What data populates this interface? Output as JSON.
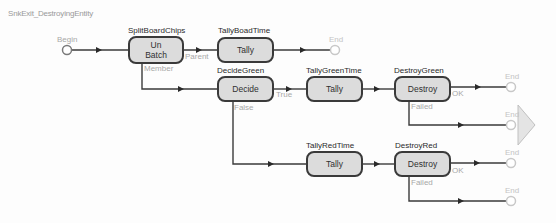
{
  "title": "SnkExit_DestroyingEntity",
  "colors": {
    "node_fill": "#dcdcdc",
    "node_border": "#3a3a3a",
    "connector": "#3a3a3a",
    "terminal": "#c8c8c8",
    "port_label": "#a8a8a8"
  },
  "terminals": {
    "begin": "Begin",
    "end": "End"
  },
  "nodes": {
    "split": {
      "name": "SplitBoardChips",
      "type_line1": "Un",
      "type_line2": "Batch"
    },
    "tally_board": {
      "name": "TallyBoadTime",
      "type": "Tally"
    },
    "decide_green": {
      "name": "DecideGreen",
      "type": "Decide"
    },
    "tally_green": {
      "name": "TallyGreenTime",
      "type": "Tally"
    },
    "destroy_green": {
      "name": "DestroyGreen",
      "type": "Destroy"
    },
    "tally_red": {
      "name": "TallyRedTime",
      "type": "Tally"
    },
    "destroy_red": {
      "name": "DestroyRed",
      "type": "Destroy"
    }
  },
  "ports": {
    "parent": "Parent",
    "member": "Member",
    "true": "True",
    "false": "False",
    "ok": "OK",
    "failed": "Failed"
  }
}
